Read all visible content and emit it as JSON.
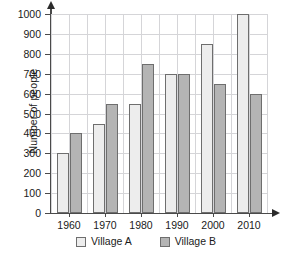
{
  "chart_data": {
    "type": "bar",
    "title": "",
    "subtitle": "",
    "xlabel": "",
    "ylabel": "Number of people",
    "categories": [
      "1960",
      "1970",
      "1980",
      "1990",
      "2000",
      "2010"
    ],
    "series": [
      {
        "name": "Village A",
        "color": "#ededed",
        "values": [
          300,
          450,
          550,
          700,
          850,
          1000
        ]
      },
      {
        "name": "Village B",
        "color": "#b4b4b4",
        "values": [
          400,
          550,
          750,
          700,
          650,
          600
        ]
      }
    ],
    "ylim": [
      0,
      1000
    ],
    "yticks": [
      0,
      100,
      200,
      300,
      400,
      500,
      600,
      700,
      800,
      900,
      1000
    ],
    "ytick_labels": [
      "0",
      "100",
      "200",
      "300",
      "400",
      "500",
      "600",
      "700",
      "800",
      "900",
      "1000"
    ],
    "grid": true,
    "grid_color": "#d5d5d8",
    "legend": [
      "Village A",
      "Village B"
    ],
    "legend_position": "bottom",
    "axis_color": "#4a4a4a",
    "background": "#ffffff"
  },
  "legend": {
    "items": [
      {
        "label": "Village A"
      },
      {
        "label": "Village B"
      }
    ]
  }
}
